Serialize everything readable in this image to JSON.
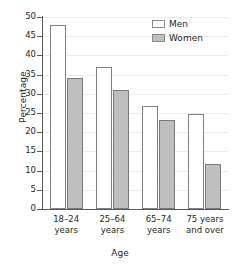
{
  "chart_data": {
    "type": "bar",
    "title": "",
    "xlabel": "Age",
    "ylabel": "Percentage",
    "ylim": [
      0,
      50
    ],
    "ytick_step": 5,
    "yticks": [
      0,
      5,
      10,
      15,
      20,
      25,
      30,
      35,
      40,
      45,
      50
    ],
    "ytick_labels": [
      "0",
      "5",
      "10",
      "15",
      "20",
      "25",
      "30",
      "35",
      "40",
      "45",
      "50"
    ],
    "grid": true,
    "grid_axis": "y",
    "legend_position": "top-right",
    "categories": [
      "18–24 years",
      "25–64 years",
      "65–74 years",
      "75 years and over"
    ],
    "category_lines": [
      [
        "18–24",
        "years"
      ],
      [
        "25–64",
        "years"
      ],
      [
        "65–74",
        "years"
      ],
      [
        "75 years",
        "and over"
      ]
    ],
    "series": [
      {
        "name": "Men",
        "values": [
          48.0,
          36.9,
          26.8,
          24.7
        ],
        "color": "#ffffff",
        "edge_color": "#808080"
      },
      {
        "name": "Women",
        "values": [
          34.0,
          31.0,
          23.1,
          11.8
        ],
        "color": "#bfbfbf",
        "edge_color": "#7a7a7a"
      }
    ]
  },
  "legend": {
    "items": [
      {
        "label": "Men",
        "swatch": "men-swatch"
      },
      {
        "label": "Women",
        "swatch": "women-swatch"
      }
    ]
  },
  "axes": {
    "y_title": "Percentage",
    "x_title": "Age"
  }
}
